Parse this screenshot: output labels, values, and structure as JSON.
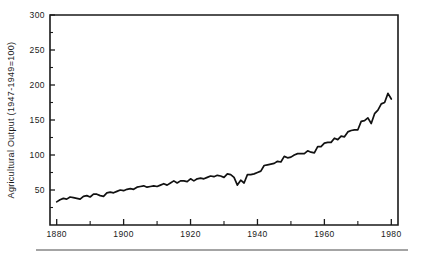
{
  "chart_data": {
    "type": "line",
    "title": "",
    "subtitle": "",
    "xlabel": "",
    "ylabel": "Agricultural Output (1947-1949=100)",
    "xlim": [
      1878,
      1982
    ],
    "ylim": [
      0,
      300
    ],
    "grid": false,
    "legend": null,
    "y_ticks": [
      0,
      50,
      100,
      150,
      200,
      250,
      300
    ],
    "y_tick_labels": [
      "",
      "50",
      "100",
      "150",
      "200",
      "250",
      "300"
    ],
    "y_minor_interval": 25,
    "x_ticks": [
      1880,
      1900,
      1920,
      1940,
      1960,
      1980
    ],
    "x_tick_labels": [
      "1880",
      "1900",
      "1920",
      "1940",
      "1960",
      "1980"
    ],
    "x_minor_ticks": [
      1890,
      1910,
      1930,
      1950,
      1970
    ],
    "series": [
      {
        "name": "Agricultural Output Index",
        "x": [
          1880,
          1881,
          1882,
          1883,
          1884,
          1885,
          1886,
          1887,
          1888,
          1889,
          1890,
          1891,
          1892,
          1893,
          1894,
          1895,
          1896,
          1897,
          1898,
          1899,
          1900,
          1901,
          1902,
          1903,
          1904,
          1905,
          1906,
          1907,
          1908,
          1909,
          1910,
          1911,
          1912,
          1913,
          1914,
          1915,
          1916,
          1917,
          1918,
          1919,
          1920,
          1921,
          1922,
          1923,
          1924,
          1925,
          1926,
          1927,
          1928,
          1929,
          1930,
          1931,
          1932,
          1933,
          1934,
          1935,
          1936,
          1937,
          1938,
          1939,
          1940,
          1941,
          1942,
          1943,
          1944,
          1945,
          1946,
          1947,
          1948,
          1949,
          1950,
          1951,
          1952,
          1953,
          1954,
          1955,
          1956,
          1957,
          1958,
          1959,
          1960,
          1961,
          1962,
          1963,
          1964,
          1965,
          1966,
          1967,
          1968,
          1969,
          1970,
          1971,
          1972,
          1973,
          1974,
          1975,
          1976,
          1977,
          1978,
          1979,
          1980
        ],
        "values": [
          33,
          36,
          38,
          37,
          40,
          39,
          38,
          37,
          41,
          42,
          40,
          44,
          44,
          42,
          41,
          46,
          47,
          46,
          48,
          50,
          49,
          51,
          52,
          51,
          54,
          55,
          56,
          54,
          55,
          56,
          55,
          57,
          59,
          57,
          60,
          63,
          60,
          63,
          63,
          62,
          66,
          63,
          66,
          67,
          66,
          68,
          70,
          69,
          71,
          70,
          68,
          73,
          72,
          68,
          57,
          64,
          60,
          72,
          72,
          73,
          75,
          77,
          85,
          86,
          87,
          88,
          91,
          90,
          98,
          96,
          97,
          100,
          102,
          102,
          102,
          106,
          104,
          103,
          112,
          112,
          117,
          118,
          118,
          124,
          122,
          127,
          126,
          133,
          135,
          136,
          136,
          148,
          149,
          153,
          145,
          159,
          164,
          173,
          175,
          188,
          180
        ]
      }
    ],
    "note": "Single black line, no markers, plotted inside a four-sided box frame with inward ticks."
  },
  "figure": {
    "y_axis_title": "Agricultural Output (1947-1949=100)",
    "background_color": "#ffffff",
    "line_color": "#111111",
    "axis_color": "#1a1a1a",
    "footer_rule_color": "#4a4a4a"
  }
}
